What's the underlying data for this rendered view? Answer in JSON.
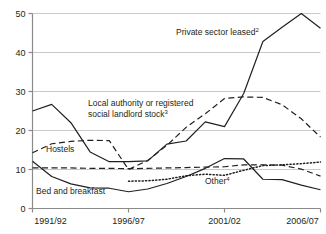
{
  "chart_data": {
    "type": "line",
    "title": "",
    "subtitle": "",
    "xlabel": "",
    "ylabel": "",
    "ylim": [
      0,
      50
    ],
    "y_ticks": [
      0,
      10,
      20,
      30,
      40,
      50
    ],
    "y_tick_labels": [
      "0",
      "10",
      "20",
      "30",
      "40",
      "50"
    ],
    "grid": "horizontal",
    "legend": "inline-annotations",
    "x": [
      "1991/92",
      "1992/93",
      "1993/94",
      "1994/95",
      "1995/96",
      "1996/97",
      "1997/98",
      "1998/99",
      "1999/00",
      "2000/01",
      "2001/02",
      "2002/03",
      "2003/04",
      "2004/05",
      "2005/06",
      "2006/07"
    ],
    "x_tick_labels": [
      "1991/92",
      "1996/97",
      "2001/02",
      "2006/07"
    ],
    "x_tick_indices": [
      0,
      5,
      10,
      15
    ],
    "series": [
      {
        "name": "Private sector leased",
        "footnote": "2",
        "style": "solid",
        "label_text": "Private sector leased",
        "values": [
          25.0,
          26.7,
          22.0,
          14.5,
          12.0,
          12.0,
          12.2,
          16.5,
          17.3,
          22.2,
          21.0,
          29.5,
          42.8,
          46.5,
          50.0,
          46.2
        ]
      },
      {
        "name": "Local authority or registered social landlord stock",
        "footnote": "3",
        "style": "dashed",
        "label_text": "Local authority or registered social landlord stock",
        "values": [
          14.3,
          16.6,
          17.2,
          17.5,
          17.4,
          10.0,
          12.3,
          16.2,
          20.8,
          24.3,
          28.2,
          28.6,
          28.5,
          26.6,
          23.0,
          18.3
        ]
      },
      {
        "name": "Hostels",
        "footnote": "",
        "style": "dashed",
        "label_text": "Hostels",
        "values": [
          10.4,
          10.4,
          10.4,
          10.3,
          10.3,
          10.2,
          10.3,
          10.4,
          10.5,
          10.6,
          10.7,
          11.2,
          11.2,
          11.1,
          10.1,
          8.3
        ]
      },
      {
        "name": "Bed and breakfast",
        "footnote": "",
        "style": "solid",
        "label_text": "Bed and breakfast",
        "values": [
          12.1,
          8.2,
          6.3,
          5.3,
          5.2,
          4.3,
          5.0,
          6.4,
          8.2,
          10.3,
          12.8,
          12.7,
          7.5,
          7.4,
          6.0,
          4.8
        ]
      },
      {
        "name": "Other",
        "footnote": "4",
        "style": "dotted",
        "label_text": "Other",
        "values": [
          null,
          null,
          null,
          null,
          null,
          7.0,
          7.1,
          7.5,
          8.4,
          8.8,
          8.5,
          9.8,
          11.0,
          11.2,
          11.5,
          11.9
        ]
      }
    ],
    "annotations": [
      {
        "text": "Private sector leased",
        "footnote": "2",
        "x": 176,
        "y": 35
      },
      {
        "text": "Local authority or registered",
        "footnote": "",
        "x": 88,
        "y": 106
      },
      {
        "text": "social landlord stock",
        "footnote": "3",
        "x": 88,
        "y": 117
      },
      {
        "text": "Hostels",
        "footnote": "",
        "x": 46,
        "y": 152
      },
      {
        "text": "Bed and breakfast",
        "footnote": "",
        "x": 36,
        "y": 194
      },
      {
        "text": "Other",
        "footnote": "4",
        "x": 205,
        "y": 184
      }
    ],
    "colors": {
      "line": "#231f20",
      "grid": "#c9c9c9",
      "axis": "#8a8a8a",
      "text": "#231f20",
      "background": "#ffffff"
    }
  }
}
